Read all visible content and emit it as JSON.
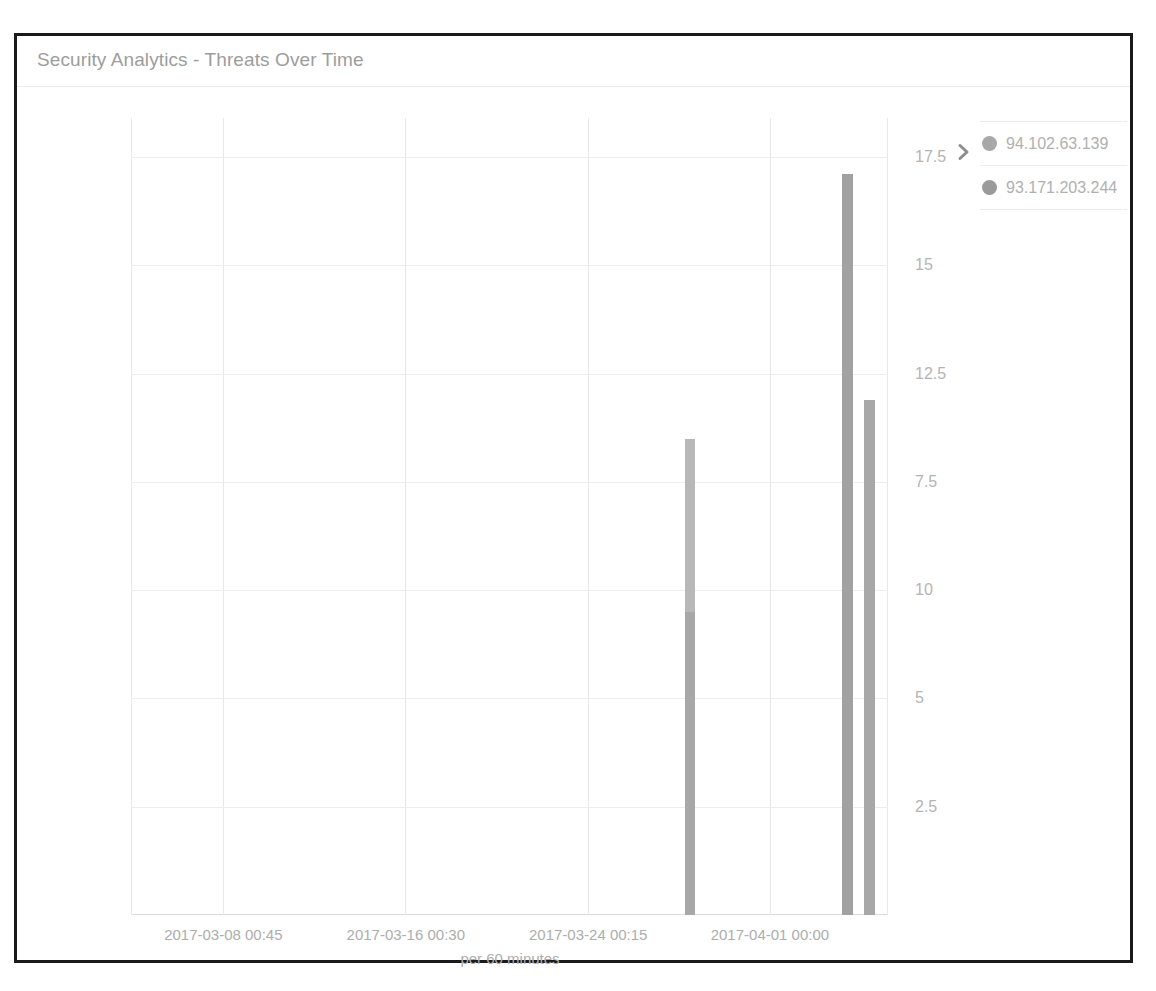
{
  "panel": {
    "title": "Security Analytics - Threats Over Time"
  },
  "legend": {
    "expand_icon": "chevron-right-icon",
    "items": [
      {
        "label": "94.102.63.139",
        "color": "#a8a8a8"
      },
      {
        "label": "93.171.203.244",
        "color": "#9a9a9a"
      }
    ]
  },
  "chart_data": {
    "type": "bar",
    "title": "Security Analytics - Threats Over Time",
    "xlabel": "per 60 minutes",
    "ylabel": "",
    "grid": true,
    "legend_position": "right",
    "stacked": true,
    "ylim": [
      0,
      18.4
    ],
    "yticks": [
      "2.5",
      "5",
      "7.5",
      "10",
      "12.5",
      "15",
      "17.5"
    ],
    "ytick_values": [
      2.5,
      5,
      10,
      7.5,
      12.5,
      15,
      17.5
    ],
    "xticks": [
      "2017-03-08 00:45",
      "2017-03-16 00:30",
      "2017-03-24 00:15",
      "2017-04-01 00:00"
    ],
    "xtick_positions_pct": [
      12.2,
      36.3,
      60.4,
      84.4
    ],
    "xlim": [
      "2017-03-04 00:52",
      "2017-04-05 23:07"
    ],
    "series": [
      {
        "name": "94.102.63.139",
        "color": "#a8a8a8"
      },
      {
        "name": "93.171.203.244",
        "color": "#9a9a9a"
      }
    ],
    "bars": [
      {
        "x_pct": 73.9,
        "time": "2017-03-28 12:00",
        "total": 11.0,
        "width_px": 10,
        "segments": [
          {
            "series": "94.102.63.139",
            "value": 7.0,
            "color": "#a8a8a8"
          },
          {
            "series": "93.171.203.244",
            "value": 4.0,
            "color": "#b8b8b8"
          }
        ]
      },
      {
        "x_pct": 94.6,
        "time": "2017-04-02 18:00",
        "total": 17.1,
        "width_px": 11,
        "segments": [
          {
            "series": "94.102.63.139",
            "value": 17.1,
            "color": "#a1a1a1"
          }
        ]
      },
      {
        "x_pct": 97.6,
        "time": "2017-04-03 12:00",
        "total": 11.9,
        "width_px": 11,
        "segments": [
          {
            "series": "93.171.203.244",
            "value": 11.9,
            "color": "#a8a8a8"
          }
        ]
      }
    ]
  }
}
